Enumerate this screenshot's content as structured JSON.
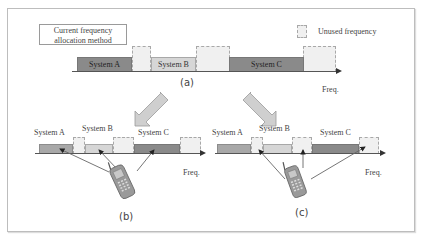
{
  "diagram": {
    "legend": {
      "current_method": "Current frequency allocation method",
      "current_method_line1": "Current frequency",
      "current_method_line2": "allocation method",
      "unused": "Unused frequency"
    },
    "panels": {
      "a": {
        "label": "(a)",
        "axis_label": "Freq.",
        "blocks": [
          {
            "type": "system",
            "label": "System A",
            "shade": "dark"
          },
          {
            "type": "unused",
            "label": ""
          },
          {
            "type": "system",
            "label": "System B",
            "shade": "light"
          },
          {
            "type": "unused",
            "label": ""
          },
          {
            "type": "system",
            "label": "System C",
            "shade": "dark"
          },
          {
            "type": "unused",
            "label": ""
          }
        ]
      },
      "b": {
        "label": "(b)",
        "axis_label": "Freq.",
        "system_labels": [
          "System A",
          "System B",
          "System C"
        ],
        "description": "Mobile terminal accesses System A, B, C bands"
      },
      "c": {
        "label": "(c)",
        "axis_label": "Freq.",
        "system_labels": [
          "System A",
          "System B",
          "System C"
        ],
        "description": "Mobile terminal accesses unused frequency bands"
      }
    },
    "colors": {
      "dark_block": "#8a8a8a",
      "light_block": "#d6d6d6",
      "unused_block": "#f0f0f0",
      "arrow_fill": "#cfcfcf"
    }
  }
}
